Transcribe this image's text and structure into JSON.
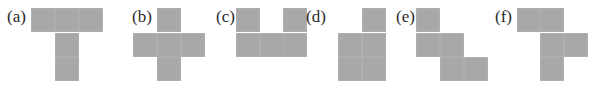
{
  "figure": {
    "panels": [
      {
        "id": "a",
        "label": "(a)",
        "label_x": 7,
        "label_y": 8,
        "squares": [
          [
            31,
            8
          ],
          [
            55,
            8
          ],
          [
            79,
            8
          ],
          [
            55,
            33
          ],
          [
            55,
            57
          ]
        ]
      },
      {
        "id": "b",
        "label": "(b)",
        "label_x": 132,
        "label_y": 8,
        "squares": [
          [
            157,
            8
          ],
          [
            133,
            33
          ],
          [
            157,
            33
          ],
          [
            181,
            33
          ],
          [
            157,
            57
          ]
        ]
      },
      {
        "id": "c",
        "label": "(c)",
        "label_x": 216,
        "label_y": 8,
        "squares": [
          [
            236,
            8
          ],
          [
            283,
            8
          ],
          [
            236,
            33
          ],
          [
            260,
            33
          ],
          [
            283,
            33
          ]
        ]
      },
      {
        "id": "d",
        "label": "(d)",
        "label_x": 306,
        "label_y": 8,
        "squares": [
          [
            362,
            8
          ],
          [
            338,
            33
          ],
          [
            362,
            33
          ],
          [
            338,
            57
          ],
          [
            362,
            57
          ]
        ]
      },
      {
        "id": "e",
        "label": "(e)",
        "label_x": 396,
        "label_y": 8,
        "squares": [
          [
            416,
            8
          ],
          [
            416,
            33
          ],
          [
            440,
            33
          ],
          [
            440,
            57
          ],
          [
            464,
            57
          ]
        ]
      },
      {
        "id": "f",
        "label": "(f)",
        "label_x": 495,
        "label_y": 8,
        "squares": [
          [
            517,
            8
          ],
          [
            540,
            8
          ],
          [
            540,
            33
          ],
          [
            564,
            33
          ],
          [
            540,
            57
          ]
        ]
      }
    ],
    "square_color": "#a8a8a8",
    "square_size": 24
  }
}
